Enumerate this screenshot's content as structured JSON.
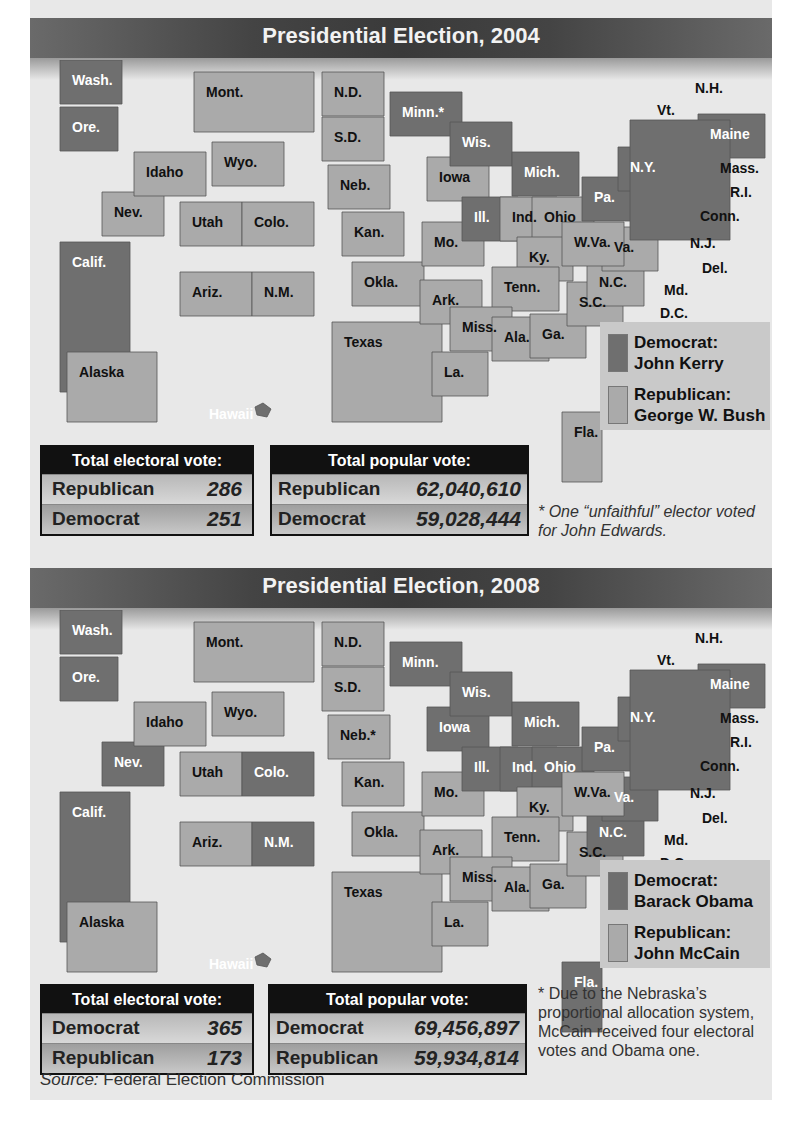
{
  "colors": {
    "democrat": "#6f6f6f",
    "republican": "#aaaaaa",
    "panel_bg": "#e8e8e8",
    "banner_dark": "#3a3a3a",
    "header_black": "#111111",
    "legend_bg": "#c9c9c9"
  },
  "source": {
    "prefix": "Source:",
    "text": " Federal Election Commission"
  },
  "elections": [
    {
      "year": 2004,
      "title": "Presidential Election, 2004",
      "legend": {
        "democrat_label": "Democrat:",
        "democrat_name": "John Kerry",
        "republican_label": "Republican:",
        "republican_name": "George W. Bush"
      },
      "electoral": {
        "header": "Total electoral vote:",
        "rows": [
          {
            "party": "Republican",
            "value": "286"
          },
          {
            "party": "Democrat",
            "value": "251"
          }
        ]
      },
      "popular": {
        "header": "Total popular vote:",
        "rows": [
          {
            "party": "Republican",
            "value": "62,040,610"
          },
          {
            "party": "Democrat",
            "value": "59,028,444"
          }
        ]
      },
      "footnote": "* One “unfaithful” elector voted for John Edwards.",
      "states": {
        "Wash.": "D",
        "Ore.": "D",
        "Calif.": "D",
        "Nev.": "R",
        "Idaho": "R",
        "Mont.": "R",
        "Wyo.": "R",
        "Utah": "R",
        "Colo.": "R",
        "Ariz.": "R",
        "N.M.": "R",
        "N.D.": "R",
        "S.D.": "R",
        "Neb.": "R",
        "Kan.": "R",
        "Okla.": "R",
        "Texas": "R",
        "Minn.*": "D",
        "Iowa": "R",
        "Mo.": "R",
        "Ark.": "R",
        "La.": "R",
        "Wis.": "D",
        "Ill.": "D",
        "Mich.": "D",
        "Ind.": "R",
        "Ohio": "R",
        "Ky.": "R",
        "Tenn.": "R",
        "Miss.": "R",
        "Ala.": "R",
        "Ga.": "R",
        "Fla.": "R",
        "S.C.": "R",
        "N.C.": "R",
        "Va.": "R",
        "W.Va.": "R",
        "Pa.": "D",
        "N.Y.": "D",
        "Vt.": "D",
        "N.H.": "D",
        "Maine": "D",
        "Mass.": "D",
        "R.I.": "D",
        "Conn.": "D",
        "N.J.": "D",
        "Del.": "D",
        "Md.": "D",
        "D.C.": "D",
        "Alaska": "R",
        "Hawaii": "D"
      }
    },
    {
      "year": 2008,
      "title": "Presidential Election, 2008",
      "legend": {
        "democrat_label": "Democrat:",
        "democrat_name": "Barack Obama",
        "republican_label": "Republican:",
        "republican_name": "John McCain"
      },
      "electoral": {
        "header": "Total electoral vote:",
        "rows": [
          {
            "party": "Democrat",
            "value": "365"
          },
          {
            "party": "Republican",
            "value": "173"
          }
        ]
      },
      "popular": {
        "header": "Total popular vote:",
        "rows": [
          {
            "party": "Democrat",
            "value": "69,456,897"
          },
          {
            "party": "Republican",
            "value": "59,934,814"
          }
        ]
      },
      "footnote": "* Due to the Nebraska’s proportional allocation system, McCain received four electoral votes and Obama one.",
      "states": {
        "Wash.": "D",
        "Ore.": "D",
        "Calif.": "D",
        "Nev.": "D",
        "Idaho": "R",
        "Mont.": "R",
        "Wyo.": "R",
        "Utah": "R",
        "Colo.": "D",
        "Ariz.": "R",
        "N.M.": "D",
        "N.D.": "R",
        "S.D.": "R",
        "Neb.*": "R",
        "Kan.": "R",
        "Okla.": "R",
        "Texas": "R",
        "Minn.": "D",
        "Iowa": "D",
        "Mo.": "R",
        "Ark.": "R",
        "La.": "R",
        "Wis.": "D",
        "Ill.": "D",
        "Mich.": "D",
        "Ind.": "D",
        "Ohio": "D",
        "Ky.": "R",
        "Tenn.": "R",
        "Miss.": "R",
        "Ala.": "R",
        "Ga.": "R",
        "Fla.": "D",
        "S.C.": "R",
        "N.C.": "D",
        "Va.": "D",
        "W.Va.": "R",
        "Pa.": "D",
        "N.Y.": "D",
        "Vt.": "D",
        "N.H.": "D",
        "Maine": "D",
        "Mass.": "D",
        "R.I.": "D",
        "Conn.": "D",
        "N.J.": "D",
        "Del.": "D",
        "Md.": "D",
        "D.C.": "D",
        "Alaska": "R",
        "Hawaii": "D"
      }
    }
  ]
}
